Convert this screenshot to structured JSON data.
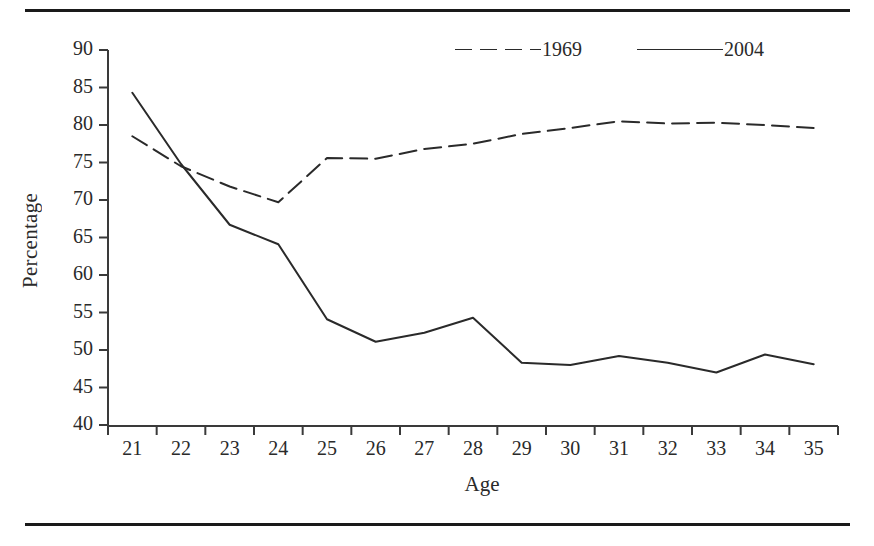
{
  "chart_data": {
    "type": "line",
    "title": "",
    "xlabel": "Age",
    "ylabel": "Percentage",
    "xlim": [
      20.5,
      35.5
    ],
    "ylim": [
      40,
      90
    ],
    "ytick_step": 5,
    "grid": false,
    "legend_position": "top-right",
    "categories": [
      21,
      22,
      23,
      24,
      25,
      26,
      27,
      28,
      29,
      30,
      31,
      32,
      33,
      34,
      35
    ],
    "xticklabels": [
      "21",
      "22",
      "23",
      "24",
      "25",
      "26",
      "27",
      "28",
      "29",
      "30",
      "31",
      "32",
      "33",
      "34",
      "35"
    ],
    "yticklabels": [
      "40",
      "45",
      "50",
      "55",
      "60",
      "65",
      "70",
      "75",
      "80",
      "85",
      "90"
    ],
    "series": [
      {
        "name": "1969",
        "style": "dashed",
        "color": "#2a2a2a",
        "values": [
          78.5,
          74.5,
          71.8,
          69.7,
          75.6,
          75.5,
          76.8,
          77.5,
          78.8,
          79.6,
          80.5,
          80.2,
          80.3,
          80.0,
          79.6
        ]
      },
      {
        "name": "2004",
        "style": "solid",
        "color": "#2a2a2a",
        "values": [
          84.3,
          74.8,
          66.7,
          64.1,
          54.1,
          51.1,
          52.3,
          54.3,
          48.3,
          48.0,
          49.2,
          48.3,
          47.0,
          49.4,
          48.1
        ]
      }
    ]
  },
  "legend": {
    "items": [
      {
        "label": "1969",
        "style": "dashed"
      },
      {
        "label": "2004",
        "style": "solid"
      }
    ]
  },
  "axes": {
    "x_title": "Age",
    "y_title": "Percentage"
  },
  "colors": {
    "line": "#2a2a2a",
    "axis": "#3a3a3a",
    "rule": "#1a1a1a",
    "background": "#ffffff"
  }
}
